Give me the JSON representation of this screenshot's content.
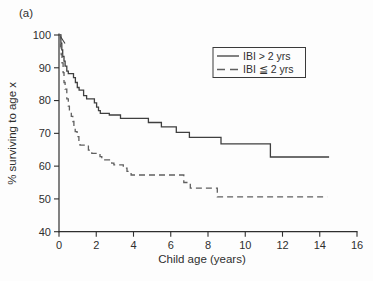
{
  "figure": {
    "panel_label": "(a)"
  },
  "colors": {
    "axis": "#2f2f2f",
    "text": "#2f2f2f",
    "solid_line": "#3f3f3f",
    "dashed_line": "#5f5f5f",
    "legend_border": "#3a3a3a",
    "background": "#fdfdfd"
  },
  "chart_data": {
    "type": "line",
    "subtype": "kaplan-meier-step-survival",
    "title": "",
    "xlabel": "Child age (years)",
    "ylabel": "% surviving to age x",
    "xlim": [
      0,
      16
    ],
    "ylim": [
      40,
      100
    ],
    "xticks": [
      0,
      2,
      4,
      6,
      8,
      10,
      12,
      14,
      16
    ],
    "yticks": [
      40,
      50,
      60,
      70,
      80,
      90,
      100
    ],
    "grid": false,
    "legend_position": "top-right",
    "series": [
      {
        "name": "IBI > 2 yrs",
        "line_style": "solid",
        "color": "#3f3f3f",
        "points": [
          [
            0,
            100
          ],
          [
            0.1,
            97.5
          ],
          [
            0.15,
            95.5
          ],
          [
            0.2,
            93.5
          ],
          [
            0.27,
            92
          ],
          [
            0.33,
            90.5
          ],
          [
            0.42,
            89
          ],
          [
            0.5,
            88.2
          ],
          [
            0.78,
            87
          ],
          [
            0.88,
            85.5
          ],
          [
            0.98,
            84
          ],
          [
            1.08,
            83.2
          ],
          [
            1.32,
            81.5
          ],
          [
            1.48,
            80.5
          ],
          [
            1.9,
            79.3
          ],
          [
            2.02,
            78
          ],
          [
            2.12,
            76.9
          ],
          [
            2.22,
            76.1
          ],
          [
            2.7,
            75.6
          ],
          [
            3.3,
            74.6
          ],
          [
            4.8,
            73.3
          ],
          [
            5.5,
            72
          ],
          [
            6.3,
            70.3
          ],
          [
            7.0,
            68.8
          ],
          [
            8.7,
            66.8
          ],
          [
            11.35,
            62.8
          ],
          [
            14.5,
            62.8
          ]
        ]
      },
      {
        "name": "IBI ≦ 2 yrs",
        "line_style": "dashed",
        "color": "#5f5f5f",
        "points": [
          [
            0,
            100
          ],
          [
            0.08,
            96.5
          ],
          [
            0.12,
            94
          ],
          [
            0.16,
            91.5
          ],
          [
            0.22,
            88.5
          ],
          [
            0.27,
            85.5
          ],
          [
            0.33,
            83.5
          ],
          [
            0.42,
            80.5
          ],
          [
            0.5,
            78.3
          ],
          [
            0.56,
            76.8
          ],
          [
            0.66,
            75.2
          ],
          [
            0.74,
            73.6
          ],
          [
            0.8,
            72
          ],
          [
            0.87,
            70.5
          ],
          [
            0.97,
            69
          ],
          [
            1.07,
            67.5
          ],
          [
            1.13,
            66.4
          ],
          [
            1.58,
            64.9
          ],
          [
            1.76,
            63.9
          ],
          [
            2.2,
            62.9
          ],
          [
            2.3,
            61.9
          ],
          [
            2.83,
            60.9
          ],
          [
            2.95,
            60.4
          ],
          [
            3.45,
            59.4
          ],
          [
            3.65,
            58.4
          ],
          [
            3.87,
            57.3
          ],
          [
            6.7,
            55
          ],
          [
            7.05,
            53.3
          ],
          [
            8.5,
            50.6
          ],
          [
            14.4,
            50.6
          ]
        ]
      }
    ]
  }
}
